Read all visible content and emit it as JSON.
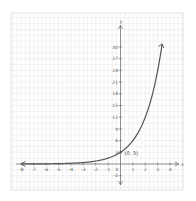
{
  "chart_data": {
    "type": "line",
    "title": "",
    "xlabel": "x",
    "ylabel": "y",
    "function": "y = 3·2^x",
    "xlim": [
      -8,
      4
    ],
    "ylim": [
      -3,
      30
    ],
    "grid": true,
    "x_ticks": [
      -8,
      -7,
      -6,
      -5,
      -4,
      -3,
      -2,
      -1,
      0,
      1,
      2,
      3,
      4
    ],
    "x_tick_labels": [
      "-8",
      "-7",
      "-6",
      "-5",
      "-4",
      "-3",
      "-2",
      "-1",
      "0",
      "1",
      "2",
      "3",
      "4"
    ],
    "y_ticks": [
      -3,
      3,
      6,
      9,
      12,
      15,
      18,
      21,
      24,
      27,
      30
    ],
    "y_tick_labels": [
      "-3",
      "3",
      "6",
      "9",
      "12",
      "15",
      "18",
      "21",
      "24",
      "27",
      "30"
    ],
    "series": [
      {
        "name": "exponential curve",
        "x": [
          -8,
          -7,
          -6,
          -5,
          -4,
          -3,
          -2,
          -1,
          0,
          1,
          2,
          3,
          3.35
        ],
        "y": [
          0.01,
          0.02,
          0.05,
          0.09,
          0.19,
          0.38,
          0.75,
          1.5,
          3,
          6,
          12,
          24,
          30.6
        ]
      }
    ],
    "annotations": [
      {
        "text": "(0, 3)",
        "x": 0,
        "y": 3
      }
    ],
    "colors": {
      "curve": "#555555",
      "axes": "#666666",
      "grid": "#dddddd",
      "background": "#ffffff"
    }
  }
}
